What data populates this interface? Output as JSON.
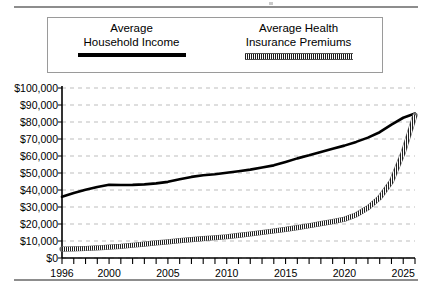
{
  "legend": {
    "items": [
      {
        "name": "average-household-income",
        "line1": "Average",
        "line2": "Household Income",
        "style": "solid-thick-black",
        "color": "#000000"
      },
      {
        "name": "average-health-insurance-premiums",
        "line1": "Average Health",
        "line2": "Insurance Premiums",
        "style": "dense-hatched-gray",
        "color": "#333333"
      }
    ]
  },
  "chart_data": {
    "type": "line",
    "title": "",
    "subtitle": "",
    "xlabel": "",
    "ylabel": "",
    "xlim": [
      1996,
      2026
    ],
    "ylim": [
      0,
      100000
    ],
    "grid": true,
    "grid_axis": "y",
    "grid_style": "dashed",
    "legend_position": "top",
    "y_ticks": [
      0,
      10000,
      20000,
      30000,
      40000,
      50000,
      60000,
      70000,
      80000,
      90000,
      100000
    ],
    "y_tick_labels": [
      "$0",
      "$10,000",
      "$20,000",
      "$30,000",
      "$40,000",
      "$50,000",
      "$60,000",
      "$70,000",
      "$80,000",
      "$90,000",
      "$100,000"
    ],
    "x_tick_labels": [
      "1996",
      "2000",
      "2005",
      "2010",
      "2015",
      "2020",
      "2025"
    ],
    "x_tick_values": [
      1996,
      2000,
      2005,
      2010,
      2015,
      2020,
      2025
    ],
    "x_minor_tick_interval": 1,
    "x": [
      1996,
      1997,
      1998,
      1999,
      2000,
      2001,
      2002,
      2003,
      2004,
      2005,
      2006,
      2007,
      2008,
      2009,
      2010,
      2011,
      2012,
      2013,
      2014,
      2015,
      2016,
      2017,
      2018,
      2019,
      2020,
      2021,
      2022,
      2023,
      2024,
      2025,
      2026
    ],
    "series": [
      {
        "name": "Average Household Income",
        "style": "solid",
        "color": "#000000",
        "values": [
          36000,
          38200,
          40100,
          41800,
          43100,
          42900,
          43000,
          43300,
          43900,
          44800,
          46300,
          47700,
          48700,
          49300,
          50100,
          51000,
          52000,
          53200,
          54500,
          56500,
          58600,
          60400,
          62400,
          64300,
          66100,
          68300,
          70800,
          74000,
          78500,
          82500,
          85000
        ]
      },
      {
        "name": "Average Health Insurance Premiums",
        "style": "hatched",
        "color": "#333333",
        "values": [
          5200,
          5400,
          5600,
          5900,
          6400,
          6800,
          7500,
          8200,
          8900,
          9500,
          10200,
          10800,
          11400,
          11900,
          12500,
          13300,
          14100,
          15000,
          15900,
          16800,
          17900,
          19000,
          20200,
          21400,
          22800,
          25400,
          29500,
          35500,
          45000,
          62000,
          84000
        ]
      }
    ]
  }
}
